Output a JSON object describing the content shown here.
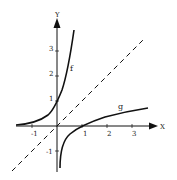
{
  "diagram": {
    "axes": {
      "x_label": "X",
      "y_label": "Y"
    },
    "x_ticks": [
      {
        "v": -1,
        "label": "-1"
      },
      {
        "v": 1,
        "label": "1"
      },
      {
        "v": 2,
        "label": "2"
      },
      {
        "v": 3,
        "label": "3"
      }
    ],
    "y_ticks": [
      {
        "v": 3,
        "label": "3"
      },
      {
        "v": 2,
        "label": "2"
      },
      {
        "v": 1,
        "label": "1"
      },
      {
        "v": -1,
        "label": "-1"
      }
    ],
    "curves": [
      {
        "name": "f",
        "label": "f",
        "description": "exponential curve"
      },
      {
        "name": "g",
        "label": "g",
        "description": "logarithm curve"
      },
      {
        "name": "y=x",
        "label": "",
        "description": "dashed line of symmetry"
      }
    ],
    "colors": {
      "ink": "#111111",
      "background": "#ffffff"
    }
  }
}
